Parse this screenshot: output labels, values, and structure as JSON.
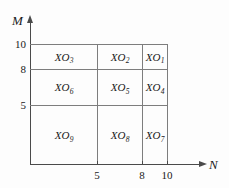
{
  "diagram": {
    "axes": {
      "vertical": {
        "name": "M",
        "ticks": [
          "10",
          "8",
          "5"
        ]
      },
      "horizontal": {
        "name": "N",
        "ticks": [
          "5",
          "8",
          "10"
        ]
      }
    },
    "colors": {
      "background": "#fdfdfd",
      "axis": "#4a4a4a",
      "grid": "#7d7d7d",
      "text": "#1a1a1a"
    },
    "cells": [
      {
        "base": "XO",
        "sub": "3",
        "row": 0,
        "col": 0
      },
      {
        "base": "XO",
        "sub": "2",
        "row": 0,
        "col": 1
      },
      {
        "base": "XO",
        "sub": "1",
        "row": 0,
        "col": 2
      },
      {
        "base": "XO",
        "sub": "6",
        "row": 1,
        "col": 0
      },
      {
        "base": "XO",
        "sub": "5",
        "row": 1,
        "col": 1
      },
      {
        "base": "XO",
        "sub": "4",
        "row": 1,
        "col": 2
      },
      {
        "base": "XO",
        "sub": "9",
        "row": 2,
        "col": 0
      },
      {
        "base": "XO",
        "sub": "8",
        "row": 2,
        "col": 1
      },
      {
        "base": "XO",
        "sub": "7",
        "row": 2,
        "col": 2
      }
    ]
  },
  "chart_data": {
    "type": "heatmap",
    "title": "",
    "xlabel": "N",
    "ylabel": "M",
    "x_ticks": [
      5,
      8,
      10
    ],
    "y_ticks": [
      5,
      8,
      10
    ],
    "xlim": [
      0,
      10
    ],
    "ylim": [
      0,
      10
    ],
    "grid": true,
    "legend": "none",
    "x_boundaries": [
      0,
      5,
      8,
      10
    ],
    "y_boundaries": [
      0,
      5,
      8,
      10
    ],
    "cell_labels": [
      [
        "XO9",
        "XO8",
        "XO7"
      ],
      [
        "XO6",
        "XO5",
        "XO4"
      ],
      [
        "XO3",
        "XO2",
        "XO1"
      ]
    ],
    "annotations": [
      "Grid partitions the N-M plane into 9 regions labeled XO1 through XO9",
      "Numbering proceeds right-to-left, top-to-bottom"
    ]
  }
}
